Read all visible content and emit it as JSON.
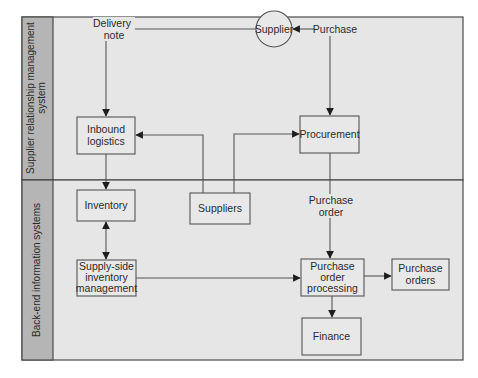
{
  "diagram": {
    "lanes": [
      {
        "label_line1": "Supplier relationship management",
        "label_line2": "system"
      },
      {
        "label_line1": "Back-end information systems"
      }
    ],
    "nodes": {
      "supplier": {
        "label": "Supplier",
        "shape": "circle"
      },
      "inbound_logistics": {
        "line1": "Inbound",
        "line2": "logistics"
      },
      "procurement": {
        "label": "Procurement"
      },
      "inventory": {
        "label": "Inventory"
      },
      "suppliers": {
        "label": "Suppliers"
      },
      "supply_side": {
        "line1": "Supply-side",
        "line2": "inventory",
        "line3": "management"
      },
      "po_processing": {
        "line1": "Purchase",
        "line2": "order",
        "line3": "processing"
      },
      "purchase_orders": {
        "line1": "Purchase",
        "line2": "orders"
      },
      "finance": {
        "label": "Finance"
      }
    },
    "edge_labels": {
      "delivery_note_line1": "Delivery",
      "delivery_note_line2": "note",
      "purchase": "Purchase",
      "purchase_order_line1": "Purchase",
      "purchase_order_line2": "order"
    },
    "edges": [
      {
        "from": "Supplier",
        "to": "Inbound logistics",
        "label": "Delivery note"
      },
      {
        "from": "Purchase",
        "to": "Supplier"
      },
      {
        "from": "Purchase",
        "to": "Procurement"
      },
      {
        "from": "Suppliers",
        "to": "Inbound logistics"
      },
      {
        "from": "Suppliers",
        "to": "Procurement"
      },
      {
        "from": "Inbound logistics",
        "to": "Inventory"
      },
      {
        "from": "Inventory",
        "to": "Supply-side inventory management",
        "bidirectional": true
      },
      {
        "from": "Procurement",
        "to": "Purchase order processing",
        "label": "Purchase order"
      },
      {
        "from": "Supply-side inventory management",
        "to": "Purchase order processing"
      },
      {
        "from": "Purchase order processing",
        "to": "Purchase orders"
      },
      {
        "from": "Purchase order processing",
        "to": "Finance"
      }
    ],
    "colors": {
      "lane_background": "#e6e6e6",
      "lane_label_background": "#b5b5b5",
      "node_fill": "#e8e8e8",
      "stroke": "#555555"
    }
  }
}
